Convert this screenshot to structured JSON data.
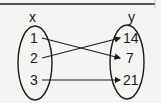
{
  "diagram": {
    "type": "mapping-diagram",
    "domain_label": "x",
    "range_label": "y",
    "domain": [
      "1",
      "2",
      "3"
    ],
    "range": [
      "14",
      "7",
      "21"
    ],
    "mappings": [
      {
        "from": "1",
        "to": "7"
      },
      {
        "from": "2",
        "to": "14"
      },
      {
        "from": "3",
        "to": "21"
      }
    ],
    "stroke_color": "#1a1a1a",
    "background": "#f4f4f2"
  }
}
